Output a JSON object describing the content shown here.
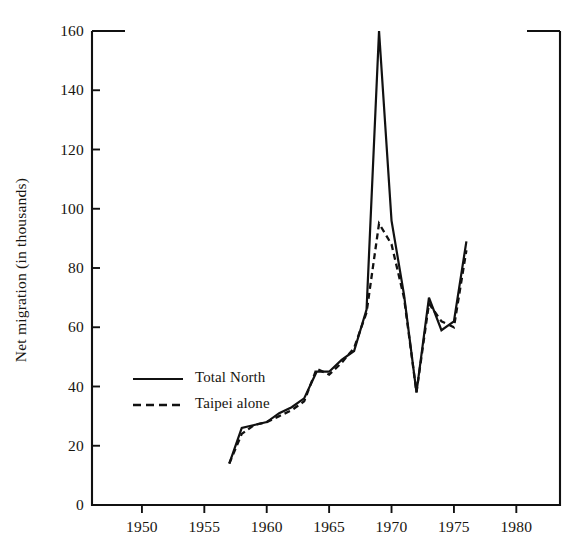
{
  "chart_data": {
    "type": "line",
    "title": "",
    "xlabel": "",
    "ylabel": "Net migration (in thousands)",
    "xlim": [
      1946,
      1983.5
    ],
    "ylim": [
      0,
      160
    ],
    "grid": false,
    "legend_position": "inside-left-center",
    "yticks": [
      0,
      20,
      40,
      60,
      80,
      100,
      120,
      140,
      160
    ],
    "ytick_labels": [
      "0",
      "20",
      "40",
      "60",
      "80",
      "100",
      "120",
      "140",
      "160"
    ],
    "xticks": [
      1950,
      1955,
      1960,
      1965,
      1970,
      1975,
      1980
    ],
    "xtick_labels": [
      "1950",
      "1955",
      "1960",
      "1965",
      "1970",
      "1975",
      "1980"
    ],
    "series": [
      {
        "name": "Total North",
        "style": "solid",
        "color": "#111111",
        "x": [
          1957,
          1958,
          1959,
          1960,
          1961,
          1962,
          1963,
          1964,
          1965,
          1966,
          1967,
          1968,
          1969,
          1970,
          1971,
          1972,
          1973,
          1974,
          1975,
          1976
        ],
        "values": [
          14,
          26,
          27,
          28,
          31,
          33,
          36,
          45,
          45,
          49,
          52,
          66,
          160,
          96,
          71,
          38,
          70,
          59,
          62,
          89
        ]
      },
      {
        "name": "Taipei alone",
        "style": "dashed",
        "color": "#111111",
        "x": [
          1957,
          1958,
          1959,
          1960,
          1961,
          1962,
          1963,
          1964,
          1965,
          1966,
          1967,
          1968,
          1969,
          1970,
          1971,
          1972,
          1973,
          1974,
          1975,
          1976
        ],
        "values": [
          14,
          24,
          27,
          28,
          30,
          32,
          35,
          46,
          44,
          48,
          53,
          65,
          95,
          88,
          70,
          38,
          68,
          62,
          60,
          86
        ]
      }
    ]
  },
  "legend": {
    "items": [
      {
        "label": "Total North",
        "style": "solid"
      },
      {
        "label": "Taipei alone",
        "style": "dashed"
      }
    ]
  },
  "axes": {
    "frame_color": "#111111"
  }
}
